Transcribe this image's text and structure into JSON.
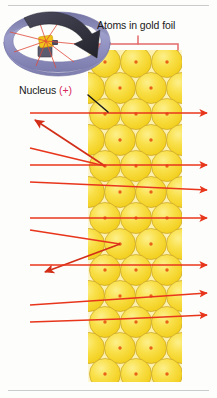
{
  "figure": {
    "labels": {
      "atoms_in_gold_foil": "Atoms in gold foil",
      "nucleus": "Nucleus ",
      "nucleus_charge": "(+)"
    },
    "colors": {
      "atom_fill": "#F7DC2E",
      "atom_fill_light": "#FDEE7A",
      "atom_edge": "#C9A227",
      "nucleus_dot": "#E8621A",
      "foil_band": "#FBF2B8",
      "foil_band_edge": "#F6E98C",
      "ray": "#E8361C",
      "ray_dark": "#C0241A",
      "bracket": "#E46A6A",
      "detector_ring": "#9C9CC8",
      "detector_ring_dark": "#6F6FA0",
      "big_arrow": "#3A3A4A",
      "source_gold": "#F0C419",
      "source_body": "#5C5C70",
      "rule": "#C9CBCC",
      "plus_red": "#D6295A",
      "background": "#FDFDFB"
    },
    "foil": {
      "band_x": 88,
      "band_width": 94,
      "atom_radius": 15.5,
      "columns": 3,
      "rows": 11
    },
    "bracket": {
      "left": 99,
      "right": 178,
      "y": 44,
      "tick_x": 138
    },
    "atom_grid": [
      {
        "row": 0,
        "offset": false,
        "cy": 62,
        "cx": [
          105,
          136,
          167
        ]
      },
      {
        "row": 1,
        "offset": true,
        "cy": 88,
        "cx": [
          120,
          151
        ]
      },
      {
        "row": 2,
        "offset": false,
        "cy": 114,
        "cx": [
          105,
          136,
          167
        ]
      },
      {
        "row": 3,
        "offset": true,
        "cy": 140,
        "cx": [
          120,
          151
        ]
      },
      {
        "row": 4,
        "offset": false,
        "cy": 166,
        "cx": [
          105,
          136,
          167
        ]
      },
      {
        "row": 5,
        "offset": true,
        "cy": 192,
        "cx": [
          120,
          151
        ]
      },
      {
        "row": 6,
        "offset": false,
        "cy": 218,
        "cx": [
          105,
          136,
          167
        ]
      },
      {
        "row": 7,
        "offset": true,
        "cy": 244,
        "cx": [
          120,
          151
        ]
      },
      {
        "row": 8,
        "offset": false,
        "cy": 270,
        "cx": [
          105,
          136,
          167
        ]
      },
      {
        "row": 9,
        "offset": true,
        "cy": 296,
        "cx": [
          120,
          151
        ]
      },
      {
        "row": 10,
        "offset": false,
        "cy": 322,
        "cx": [
          105,
          136,
          167
        ]
      },
      {
        "row": 11,
        "offset": true,
        "cy": 348,
        "cx": [
          120,
          151
        ]
      },
      {
        "row": 12,
        "offset": false,
        "cy": 374,
        "cx": [
          105,
          136,
          167
        ]
      }
    ],
    "rays": [
      {
        "id": "ray-1",
        "type": "undeflected",
        "entry_y": 113,
        "exit_y": 113,
        "label": "passes straight through"
      },
      {
        "id": "ray-2",
        "type": "deflected-back",
        "entry_y": 148,
        "exit_y": 118,
        "label": "deflected at large angle back toward source"
      },
      {
        "id": "ray-3",
        "type": "undeflected",
        "entry_y": 165,
        "exit_y": 165,
        "label": "passes straight through"
      },
      {
        "id": "ray-4",
        "type": "slight",
        "entry_y": 182,
        "exit_y": 188,
        "label": "slightly deflected"
      },
      {
        "id": "ray-5",
        "type": "undeflected",
        "entry_y": 218,
        "exit_y": 218,
        "label": "passes straight through"
      },
      {
        "id": "ray-6",
        "type": "deflected-back",
        "entry_y": 230,
        "exit_y": 252,
        "label": "deflected at large angle back toward source"
      },
      {
        "id": "ray-7",
        "type": "undeflected",
        "entry_y": 265,
        "exit_y": 265,
        "label": "passes straight through"
      },
      {
        "id": "ray-8",
        "type": "slight",
        "entry_y": 305,
        "exit_y": 296,
        "label": "slightly deflected"
      },
      {
        "id": "ray-9",
        "type": "slight",
        "entry_y": 322,
        "exit_y": 318,
        "label": "slightly deflected"
      }
    ],
    "inset": {
      "name": "detector-screen-inset",
      "description": "Circular fluorescent detector screen ring surrounding gold foil sample with alpha source emitting rays",
      "ring_cx": 57,
      "ring_cy": 45,
      "source_cx": 45,
      "source_cy": 46
    },
    "rules": {
      "top_y": 5,
      "bottom_y": 390
    }
  }
}
